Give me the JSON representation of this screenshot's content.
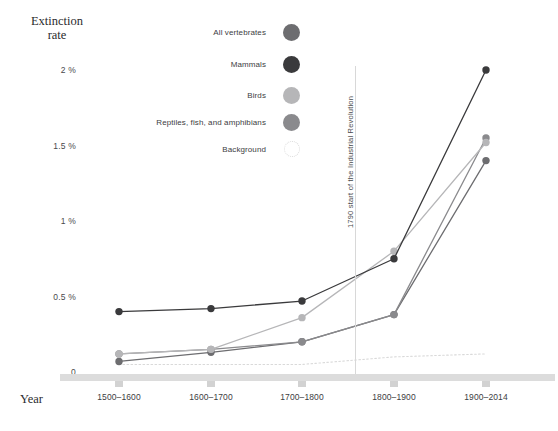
{
  "chart_data": {
    "type": "line",
    "title": "Extinction rate",
    "ylabel": "Extinction rate",
    "xlabel": "Year",
    "categories": [
      "1500–1600",
      "1600–1700",
      "1700–1800",
      "1800–1900",
      "1900–2014"
    ],
    "ytick_labels": [
      "0",
      "0.5 %",
      "1 %",
      "1.5 %",
      "2 %"
    ],
    "ytick_values": [
      0,
      0.5,
      1,
      1.5,
      2
    ],
    "ylim": [
      0,
      2.1
    ],
    "unit": "%",
    "grid": false,
    "legend_position": "top-center",
    "series": [
      {
        "name": "All vertebrates",
        "color": "#6d6d70",
        "style": "solid",
        "values": [
          0.07,
          0.13,
          0.2,
          0.38,
          1.4
        ]
      },
      {
        "name": "Mammals",
        "color": "#3a3a3c",
        "style": "solid",
        "values": [
          0.4,
          0.42,
          0.47,
          0.75,
          2.0
        ]
      },
      {
        "name": "Birds",
        "color": "#b6b6b8",
        "style": "solid",
        "values": [
          0.12,
          0.15,
          0.36,
          0.8,
          1.52
        ]
      },
      {
        "name": "Reptiles, fish, and amphibians",
        "color": "#8a8a8d",
        "style": "solid",
        "values": [
          0.12,
          0.15,
          0.2,
          0.38,
          1.55
        ]
      },
      {
        "name": "Background",
        "color": "#d9d9d9",
        "style": "dotted",
        "values": [
          0.05,
          0.05,
          0.05,
          0.1,
          0.12
        ]
      }
    ],
    "annotations": [
      {
        "text": "1790 start of the Industrial Revolution",
        "orientation": "vertical",
        "x_value": 1790
      }
    ]
  },
  "legend": {
    "items": [
      {
        "label": "All vertebrates",
        "icon": "filled-circle",
        "color": "#6d6d70"
      },
      {
        "label": "Mammals",
        "icon": "filled-circle",
        "color": "#3a3a3c"
      },
      {
        "label": "Birds",
        "icon": "filled-circle",
        "color": "#b6b6b8"
      },
      {
        "label": "Reptiles, fish, and amphibians",
        "icon": "filled-circle",
        "color": "#8a8a8d"
      },
      {
        "label": "Background",
        "icon": "dotted-circle",
        "color": "#d9d9d9"
      }
    ]
  },
  "axes": {
    "y_title_line1": "Extinction",
    "y_title_line2": "rate",
    "x_title": "Year"
  }
}
